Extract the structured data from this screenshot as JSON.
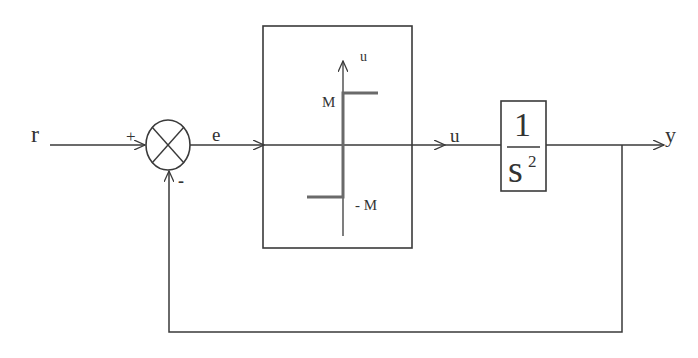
{
  "diagram": {
    "type": "closed-loop control block diagram",
    "signals": {
      "input": "r",
      "error": "e",
      "control": "u",
      "output": "y"
    },
    "summing_junction": {
      "plus_sign": "+",
      "minus_sign": "-"
    },
    "nonlinearity_block": {
      "axis_label": "u",
      "upper_level": "M",
      "lower_level": "- M",
      "description": "relay (sign) nonlinearity"
    },
    "plant_block": {
      "numerator": "1",
      "denominator": "s",
      "exponent": "2"
    },
    "colors": {
      "line": "#3a3a3a",
      "relay_curve": "#6a6a6a"
    }
  }
}
